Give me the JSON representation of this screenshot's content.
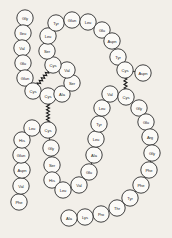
{
  "figure": {
    "background_color": "#f2efe9",
    "circle_fill": "#fbfaf7",
    "stroke_color": "#2b2b2b",
    "bond_color": "#1a1a1a"
  },
  "residues": [
    {
      "id": "r1",
      "label": "Gly",
      "x": 25,
      "y": 18
    },
    {
      "id": "r2",
      "label": "Ileu",
      "x": 23,
      "y": 33
    },
    {
      "id": "r3",
      "label": "Val",
      "x": 22,
      "y": 48
    },
    {
      "id": "r4",
      "label": "Glu",
      "x": 23,
      "y": 63
    },
    {
      "id": "r5",
      "label": "Glun",
      "x": 25,
      "y": 78
    },
    {
      "id": "r6",
      "label": "Cys",
      "x": 33,
      "y": 91
    },
    {
      "id": "r7",
      "label": "Cys",
      "x": 48,
      "y": 96
    },
    {
      "id": "r8",
      "label": "Ala",
      "x": 62,
      "y": 94
    },
    {
      "id": "r9",
      "label": "Ser",
      "x": 72,
      "y": 83
    },
    {
      "id": "r10",
      "label": "Val",
      "x": 67,
      "y": 70
    },
    {
      "id": "r11",
      "label": "Cys",
      "x": 53,
      "y": 65
    },
    {
      "id": "r12",
      "label": "Ser",
      "x": 47,
      "y": 51
    },
    {
      "id": "r13",
      "label": "Leu",
      "x": 48,
      "y": 36
    },
    {
      "id": "r14",
      "label": "Tyr",
      "x": 56,
      "y": 23
    },
    {
      "id": "r15",
      "label": "Glun",
      "x": 72,
      "y": 20
    },
    {
      "id": "r16",
      "label": "Leu",
      "x": 88,
      "y": 22
    },
    {
      "id": "r17",
      "label": "Glu",
      "x": 102,
      "y": 30
    },
    {
      "id": "r18",
      "label": "Aspn",
      "x": 112,
      "y": 41
    },
    {
      "id": "r19",
      "label": "Tyr",
      "x": 118,
      "y": 57
    },
    {
      "id": "r20",
      "label": "Cys",
      "x": 125,
      "y": 70
    },
    {
      "id": "r21",
      "label": "Aspn",
      "x": 143,
      "y": 73
    },
    {
      "id": "b1",
      "label": "Phe",
      "x": 19,
      "y": 202
    },
    {
      "id": "b2",
      "label": "Val",
      "x": 21,
      "y": 186
    },
    {
      "id": "b3",
      "label": "Aspn",
      "x": 22,
      "y": 170
    },
    {
      "id": "b4",
      "label": "Glun",
      "x": 21,
      "y": 155
    },
    {
      "id": "b5",
      "label": "His",
      "x": 22,
      "y": 140
    },
    {
      "id": "b6",
      "label": "Leu",
      "x": 32,
      "y": 128
    },
    {
      "id": "b7",
      "label": "Cys",
      "x": 48,
      "y": 130
    },
    {
      "id": "b8",
      "label": "Gly",
      "x": 51,
      "y": 148
    },
    {
      "id": "b9",
      "label": "Ser",
      "x": 52,
      "y": 165
    },
    {
      "id": "b10",
      "label": "His",
      "x": 52,
      "y": 180
    },
    {
      "id": "b11",
      "label": "Leu",
      "x": 63,
      "y": 190
    },
    {
      "id": "b12",
      "label": "Val",
      "x": 79,
      "y": 185
    },
    {
      "id": "b13",
      "label": "Glu",
      "x": 89,
      "y": 172
    },
    {
      "id": "b14",
      "label": "Ala",
      "x": 94,
      "y": 155
    },
    {
      "id": "b15",
      "label": "Leu",
      "x": 96,
      "y": 139
    },
    {
      "id": "b16",
      "label": "Tyr",
      "x": 99,
      "y": 124
    },
    {
      "id": "b17",
      "label": "Leu",
      "x": 102,
      "y": 108
    },
    {
      "id": "b18",
      "label": "Val",
      "x": 110,
      "y": 94
    },
    {
      "id": "b19",
      "label": "Cys",
      "x": 126,
      "y": 97
    },
    {
      "id": "b20",
      "label": "Gly",
      "x": 139,
      "y": 108
    },
    {
      "id": "b21",
      "label": "Glu",
      "x": 146,
      "y": 122
    },
    {
      "id": "b22",
      "label": "Arg",
      "x": 150,
      "y": 137
    },
    {
      "id": "b23",
      "label": "Gly",
      "x": 152,
      "y": 153
    },
    {
      "id": "b24",
      "label": "Phe",
      "x": 149,
      "y": 170
    },
    {
      "id": "b25",
      "label": "Phe",
      "x": 141,
      "y": 185
    },
    {
      "id": "b26",
      "label": "Tyr",
      "x": 130,
      "y": 198
    },
    {
      "id": "b27",
      "label": "Thr",
      "x": 117,
      "y": 208
    },
    {
      "id": "b28",
      "label": "Pro",
      "x": 101,
      "y": 214
    },
    {
      "id": "b29",
      "label": "Lys",
      "x": 85,
      "y": 217
    },
    {
      "id": "b30",
      "label": "Ala",
      "x": 69,
      "y": 218
    }
  ],
  "backbone_chains": [
    [
      "r1",
      "r2",
      "r3",
      "r4",
      "r5",
      "r6",
      "r7",
      "r8",
      "r9",
      "r10",
      "r11",
      "r12",
      "r13",
      "r14",
      "r15",
      "r16",
      "r17",
      "r18",
      "r19",
      "r20",
      "r21"
    ],
    [
      "b1",
      "b2",
      "b3",
      "b4",
      "b5",
      "b6",
      "b7",
      "b8",
      "b9",
      "b10",
      "b11",
      "b12",
      "b13",
      "b14",
      "b15",
      "b16",
      "b17",
      "b18",
      "b19",
      "b20",
      "b21",
      "b22",
      "b23",
      "b24",
      "b25",
      "b26",
      "b27",
      "b28",
      "b29",
      "b30"
    ]
  ],
  "disulfide_bonds": [
    {
      "from": "r6",
      "to": "r11"
    },
    {
      "from": "r7",
      "to": "b7"
    },
    {
      "from": "r20",
      "to": "b19"
    }
  ],
  "residue_radius": 8.2
}
